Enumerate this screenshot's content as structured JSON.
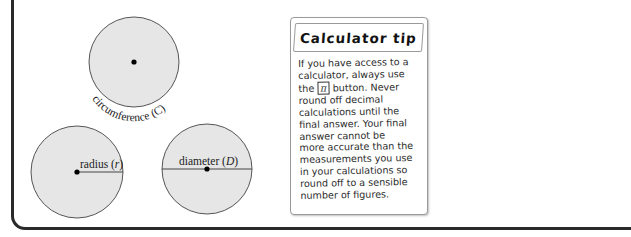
{
  "diagram": {
    "circles": [
      {
        "id": "top",
        "label": "circumference",
        "symbol": "C"
      },
      {
        "id": "bottom-left",
        "label": "radius",
        "symbol": "r"
      },
      {
        "id": "bottom-right",
        "label": "diameter",
        "symbol": "D"
      }
    ],
    "labels": {
      "circumference": "circumference (C)",
      "radius_word": "radius (",
      "radius_symbol": "r",
      "diameter_word": "diameter (",
      "diameter_symbol": "D",
      "close_paren": ")"
    },
    "colors": {
      "circle_fill": "#e6e6e6",
      "circle_stroke": "#555555",
      "frame": "#2a2a2a"
    }
  },
  "tip": {
    "title": "Calculator tip",
    "lines": [
      "If you have access to a",
      "calculator, always use",
      "the",
      "button. Never",
      "round off decimal",
      "calculations until the",
      "final answer. Your final",
      "answer cannot be",
      "more accurate than the",
      "measurements you use",
      "in your calculations so",
      "round off to a sensible",
      "number of figures."
    ],
    "pi_key": "π"
  }
}
